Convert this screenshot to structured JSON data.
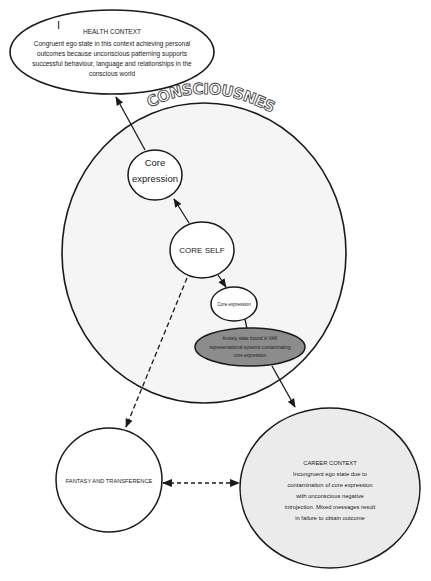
{
  "title": "CONSCIOUSNESS",
  "nodes": {
    "health_context": {
      "heading": "HEALTH CONTEXT",
      "cursor_glyph": "I",
      "lines": [
        "Congruent ego state in this context achieving personal",
        "outcomes because unconscious patterning supports",
        "successful behaviour, language and relationships in the",
        "conscious world"
      ]
    },
    "core_expression_top": {
      "lines": [
        "Core",
        "expression"
      ]
    },
    "core_self": {
      "label": "CORE SELF"
    },
    "core_expression_small": {
      "label": "Core expression"
    },
    "anxiety_state": {
      "lines": [
        "Anxiety state bound in VAK",
        "representational systems contaminating",
        "core expression"
      ]
    },
    "fantasy": {
      "label": "FANTASY AND TRANSFERENCE"
    },
    "career_context": {
      "heading": "CAREER CONTEXT",
      "lines": [
        "Incongruent ego state due to",
        "contamination of core expression",
        "with unconscious negative",
        "introjection. Mixed messages result",
        "in failure to obtain outcome"
      ]
    }
  },
  "edges": [
    {
      "from": "core_expression_top",
      "to": "health_context",
      "style": "solid",
      "direction": "forward"
    },
    {
      "from": "core_self",
      "to": "core_expression_top",
      "style": "solid",
      "direction": "forward"
    },
    {
      "from": "core_self",
      "to": "core_expression_small",
      "style": "solid",
      "direction": "forward"
    },
    {
      "from": "core_expression_small",
      "to": "anxiety_state",
      "style": "solid",
      "direction": "none"
    },
    {
      "from": "anxiety_state",
      "to": "career_context",
      "style": "solid",
      "direction": "forward"
    },
    {
      "from": "core_self",
      "to": "fantasy",
      "style": "dashed",
      "direction": "forward"
    },
    {
      "from": "fantasy",
      "to": "career_context",
      "style": "dashed",
      "direction": "both"
    }
  ],
  "colors": {
    "stroke": "#1a1a1a",
    "consciousness_fill": "#f5f5f5",
    "career_fill": "#ebebeb",
    "anxiety_fill": "#8c8c8c",
    "white_fill": "#ffffff"
  }
}
